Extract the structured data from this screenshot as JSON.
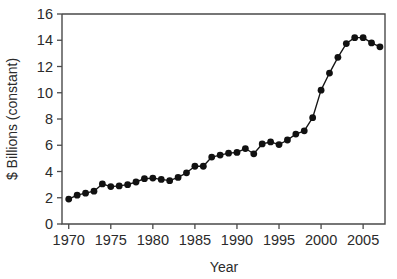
{
  "chart_data": {
    "type": "line",
    "title": "",
    "subtitle": "",
    "xlabel": "Year",
    "ylabel": "$ Billions (constant)",
    "xlim": [
      1969.2,
      2007.6
    ],
    "ylim": [
      0,
      16
    ],
    "xticks": [
      1970,
      1975,
      1980,
      1985,
      1990,
      1995,
      2000,
      2005
    ],
    "xtick_labels": [
      "1970",
      "1975",
      "1980",
      "1985",
      "1990",
      "1995",
      "2000",
      "2005"
    ],
    "yticks": [
      0,
      2,
      4,
      6,
      8,
      10,
      12,
      14,
      16
    ],
    "ytick_labels": [
      "0",
      "2",
      "4",
      "6",
      "8",
      "10",
      "12",
      "14",
      "16"
    ],
    "grid": false,
    "legend": false,
    "legend_position": "none",
    "marker": "filled-circle",
    "marker_color": "#111111",
    "line_color": "#151515",
    "axis_color": "#4a4a4a",
    "background_color": "#ffffff",
    "x": [
      1970,
      1971,
      1972,
      1973,
      1974,
      1975,
      1976,
      1977,
      1978,
      1979,
      1980,
      1981,
      1982,
      1983,
      1984,
      1985,
      1986,
      1987,
      1988,
      1989,
      1990,
      1991,
      1992,
      1993,
      1994,
      1995,
      1996,
      1997,
      1998,
      1999,
      2000,
      2001,
      2002,
      2003,
      2004,
      2005,
      2006,
      2007
    ],
    "values": [
      1.9,
      2.2,
      2.35,
      2.5,
      3.05,
      2.85,
      2.9,
      3.0,
      3.2,
      3.45,
      3.5,
      3.4,
      3.3,
      3.55,
      3.9,
      4.4,
      4.4,
      5.1,
      5.25,
      5.4,
      5.45,
      5.75,
      5.35,
      6.1,
      6.25,
      6.05,
      6.4,
      6.85,
      7.1,
      8.1,
      10.2,
      11.5,
      12.7,
      13.75,
      14.2,
      14.2,
      13.8,
      13.5
    ],
    "series": [
      {
        "name": "$ Billions (constant)",
        "values": [
          1.9,
          2.2,
          2.35,
          2.5,
          3.05,
          2.85,
          2.9,
          3.0,
          3.2,
          3.45,
          3.5,
          3.4,
          3.3,
          3.55,
          3.9,
          4.4,
          4.4,
          5.1,
          5.25,
          5.4,
          5.45,
          5.75,
          5.35,
          6.1,
          6.25,
          6.05,
          6.4,
          6.85,
          7.1,
          8.1,
          10.2,
          11.5,
          12.7,
          13.75,
          14.2,
          14.2,
          13.8,
          13.5
        ]
      }
    ],
    "annotations": []
  }
}
